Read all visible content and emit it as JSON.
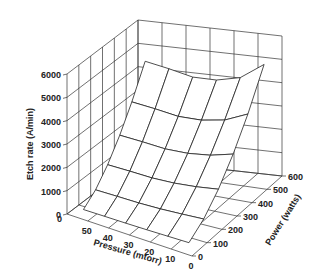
{
  "chart_data": {
    "type": "surface3d",
    "title": "",
    "zlabel": "Etch rate (A/min)",
    "xlabel": "Pressure (mtorr)",
    "ylabel": "Power (watts)",
    "z_ticks": [
      "0",
      "1000",
      "2000",
      "3000",
      "4000",
      "5000",
      "6000"
    ],
    "x_ticks": [
      "50",
      "40",
      "30",
      "20",
      "10",
      "0"
    ],
    "y_ticks": [
      "0",
      "100",
      "200",
      "300",
      "400",
      "500",
      "600"
    ],
    "zlim": [
      0,
      6000
    ],
    "xlim": [
      0,
      60
    ],
    "ylim": [
      0,
      600
    ],
    "grid": true,
    "x": [
      10,
      20,
      30,
      40,
      50
    ],
    "y": [
      100,
      200,
      300,
      400,
      500
    ],
    "z": [
      [
        300,
        200,
        150,
        200,
        300
      ],
      [
        1100,
        900,
        850,
        900,
        1200
      ],
      [
        2200,
        2000,
        1950,
        2000,
        2500
      ],
      [
        3500,
        3200,
        3150,
        3300,
        3900
      ],
      [
        4600,
        4400,
        4350,
        4500,
        5200
      ]
    ]
  }
}
